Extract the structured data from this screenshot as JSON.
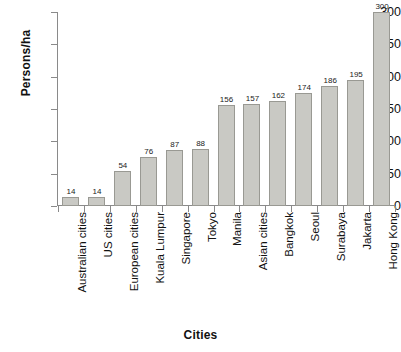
{
  "chart_data": {
    "type": "bar",
    "title": "",
    "xlabel": "Cities",
    "ylabel": "Persons/ha",
    "categories": [
      "Australian cities",
      "US cities",
      "European cities",
      "Kuala Lumpur",
      "Singapore",
      "Tokyo",
      "Manila",
      "Asian cities",
      "Bangkok",
      "Seoul",
      "Surabaya",
      "Jakarta",
      "Hong Kong"
    ],
    "values": [
      14,
      14,
      54,
      76,
      87,
      88,
      156,
      157,
      162,
      174,
      186,
      195,
      300
    ],
    "value_labels": [
      "14",
      "14",
      "54",
      "76",
      "87",
      "88",
      "156",
      "157",
      "162",
      "174",
      "186",
      "195",
      "300"
    ],
    "ylim": [
      0,
      300
    ],
    "yticks": [
      0,
      50,
      100,
      150,
      200,
      250,
      300
    ],
    "ytick_labels": [
      "0",
      "50",
      "100",
      "150",
      "200",
      "250",
      "300"
    ],
    "grid": false,
    "legend": false,
    "bar_color": "#c9c9c4",
    "bar_border_color": "#999993",
    "axis_color": "#8a8a8a",
    "text_color": "#111111"
  }
}
